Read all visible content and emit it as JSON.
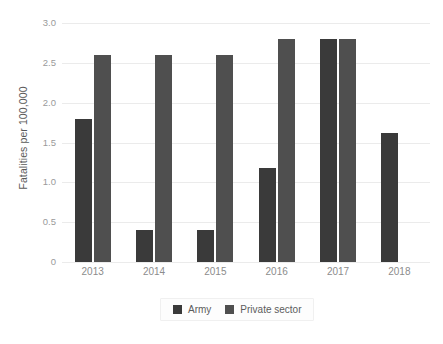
{
  "chart_data": {
    "type": "bar",
    "title": "",
    "subtitle": "",
    "xlabel": "",
    "ylabel": "Fatalities per 100,000",
    "categories": [
      "2013",
      "2014",
      "2015",
      "2016",
      "2017",
      "2018"
    ],
    "series": [
      {
        "name": "Army",
        "color": "#3a3a3a",
        "values": [
          1.8,
          0.4,
          0.4,
          1.18,
          2.8,
          1.62
        ]
      },
      {
        "name": "Private sector",
        "color": "#4f4f4f",
        "values": [
          2.6,
          2.6,
          2.6,
          2.8,
          2.8,
          null
        ]
      }
    ],
    "ylim": [
      0,
      3.0
    ],
    "yticks": [
      0,
      0.5,
      1.0,
      1.5,
      2.0,
      2.5,
      3.0
    ],
    "ytick_labels": [
      "0",
      "0.5",
      "1.0",
      "1.5",
      "2.0",
      "2.5",
      "3.0"
    ],
    "grid": true,
    "grid_axis": "y",
    "legend_position": "bottom",
    "background_color": "#ffffff",
    "grid_color": "#ebebeb"
  },
  "legend": {
    "entries": [
      {
        "label": "Army",
        "color": "#3a3a3a"
      },
      {
        "label": "Private sector",
        "color": "#4f4f4f"
      }
    ]
  }
}
